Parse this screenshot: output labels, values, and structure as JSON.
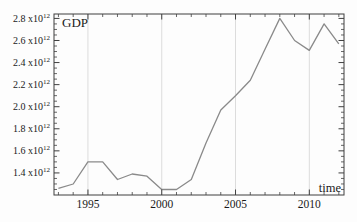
{
  "window": {
    "background": "#fdfdfd"
  },
  "chart_data": {
    "type": "line",
    "title": "",
    "ylabel": "GDP",
    "xlabel": "time",
    "x": [
      1993,
      1994,
      1995,
      1996,
      1997,
      1998,
      1999,
      2000,
      2001,
      2002,
      2003,
      2004,
      2005,
      2006,
      2007,
      2008,
      2009,
      2010,
      2011,
      2012
    ],
    "series": [
      {
        "name": "GDP",
        "values_e12": [
          1.26,
          1.3,
          1.5,
          1.5,
          1.34,
          1.39,
          1.37,
          1.25,
          1.25,
          1.34,
          1.67,
          1.97,
          2.1,
          2.24,
          2.52,
          2.8,
          2.6,
          2.51,
          2.75,
          2.57
        ]
      }
    ],
    "y_unit_exponent": 12,
    "x_major_ticks": [
      1995,
      2000,
      2005,
      2010
    ],
    "x_tick_labels": [
      "1995",
      "2000",
      "2005",
      "2010"
    ],
    "x_minor_tick_step_years": 1,
    "y_major_ticks_e12": [
      1.4,
      1.6,
      1.8,
      2.0,
      2.2,
      2.4,
      2.6,
      2.8
    ],
    "y_tick_labels": [
      "1.4 x10^12",
      "1.6 x10^12",
      "1.8 x10^12",
      "2.0 x10^12",
      "2.2 x10^12",
      "2.4 x10^12",
      "2.6 x10^12",
      "2.8 x10^12"
    ],
    "y_minor_tick_step_e12": 0.05,
    "x_range": [
      1992.7,
      2012.35
    ],
    "y_range_e12": [
      1.2,
      2.84
    ],
    "grid": "vertical-lines-at-x-major-ticks",
    "legend": "none",
    "colors": {
      "line": "#8a8a8a",
      "grid": "#dcdcdc",
      "frame": "#3f3f3f",
      "text": "#1a1a1a"
    }
  }
}
